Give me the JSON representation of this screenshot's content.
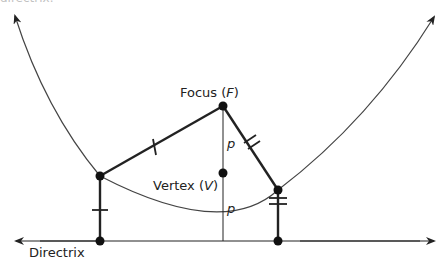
{
  "diagram": {
    "title_fragment": "directrix.",
    "labels": {
      "focus": "Focus (",
      "focus_var": "F",
      "focus_close": ")",
      "vertex": "Vertex (",
      "vertex_var": "V",
      "vertex_close": ")",
      "p_upper": "p",
      "p_lower": "p",
      "directrix": "Directrix"
    },
    "points": {
      "focus": [
        223,
        106
      ],
      "vertex": [
        223,
        173
      ],
      "point_left": [
        100,
        176
      ],
      "point_right": [
        278,
        190
      ],
      "foot_left": [
        100,
        241
      ],
      "foot_right": [
        278,
        241
      ]
    },
    "colors": {
      "stroke": "#222222",
      "curve": "#444444"
    }
  }
}
